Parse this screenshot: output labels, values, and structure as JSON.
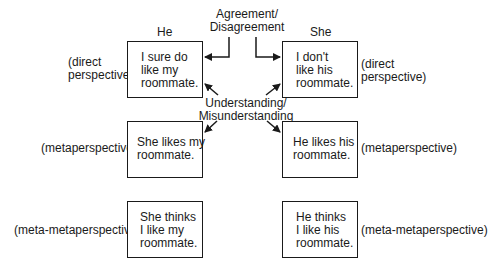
{
  "columns": {
    "he": "He",
    "she": "She"
  },
  "connectors": {
    "agreement": "Agreement/\nDisagreement",
    "understanding": "Understanding/\nMisunderstanding"
  },
  "levels": [
    {
      "left_label": "(direct\nperspective)",
      "right_label": "(direct\nperspective)",
      "he_box": "I sure do\nlike my\nroommate.",
      "she_box": "I don't\nlike his\nroommate."
    },
    {
      "left_label": "(metaperspective)",
      "right_label": "(metaperspective)",
      "he_box": "She likes my\nroommate.",
      "she_box": "He likes his\nroommate."
    },
    {
      "left_label": "(meta-metaperspective)",
      "right_label": "(meta-metaperspective)",
      "he_box": "She thinks\nI like my\nroommate.",
      "she_box": "He thinks\nI like his\nroommate."
    }
  ]
}
